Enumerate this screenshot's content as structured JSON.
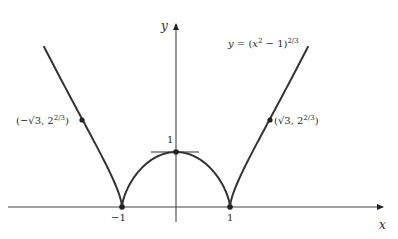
{
  "diagram": {
    "equation": {
      "lhs": "y",
      "eq": " = (",
      "var": "x",
      "sq": "2",
      "rest": " − 1)",
      "exp": "2/3"
    },
    "axes": {
      "x_label": "x",
      "y_label": "y"
    },
    "ticks": {
      "x_neg_one": "−1",
      "x_one": "1",
      "y_one": "1"
    },
    "points": {
      "left": {
        "open": "(−√3, 2",
        "exp": "2/3",
        "close": ")"
      },
      "right": {
        "open": "(√3, 2",
        "exp": "2/3",
        "close": ")"
      }
    },
    "colors": {
      "curve": "#333333",
      "axis": "#444444",
      "background": "#ffffff"
    }
  },
  "chart_data": {
    "type": "line",
    "xlabel": "x",
    "ylabel": "y",
    "function": "(x^2 - 1)^(2/3)",
    "xlim": [
      -3.2,
      4.0
    ],
    "ylim": [
      -0.6,
      3.7
    ],
    "x_ticks": [
      -1,
      1
    ],
    "y_ticks": [
      1
    ],
    "marked_points": [
      {
        "x": -1.732,
        "y": 1.587,
        "label": "(-√3, 2^(2/3))"
      },
      {
        "x": -1,
        "y": 0,
        "label": "-1"
      },
      {
        "x": 0,
        "y": 1,
        "label": "1",
        "note": "horizontal tangent (local max)"
      },
      {
        "x": 1,
        "y": 0,
        "label": "1"
      },
      {
        "x": 1.732,
        "y": 1.587,
        "label": "(√3, 2^(2/3))"
      }
    ],
    "features": [
      "cusps at x = ±1",
      "horizontal tangent at (0,1)"
    ],
    "grid": false
  }
}
